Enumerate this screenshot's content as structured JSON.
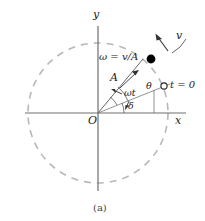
{
  "figure": {
    "caption": "(a)",
    "type": "circular-motion-phasor-diagram"
  },
  "axes": {
    "x_label": "x",
    "y_label": "y",
    "origin_label": "O",
    "color": "#6e6e6e"
  },
  "circle": {
    "style": "dashed",
    "color": "#b3b3b3",
    "center_x": 98,
    "center_y": 113,
    "radius": 70
  },
  "labels": {
    "angular_frequency": "ω = v/A",
    "amplitude": "A",
    "velocity": "v",
    "angle_total": "θ",
    "angle_omega_t": "ωt",
    "angle_phase": "δ",
    "initial_time": "t = 0"
  },
  "markers": {
    "particle_style": "filled-dot",
    "particle_color": "#000000",
    "initial_position_style": "open-circle",
    "initial_position_color": "#000000"
  },
  "geometry": {
    "particle_angle_deg": 50,
    "initial_angle_deg": 22,
    "angle_theta_deg": 50,
    "angle_omega_t_deg": 28,
    "angle_delta_deg": 22
  }
}
